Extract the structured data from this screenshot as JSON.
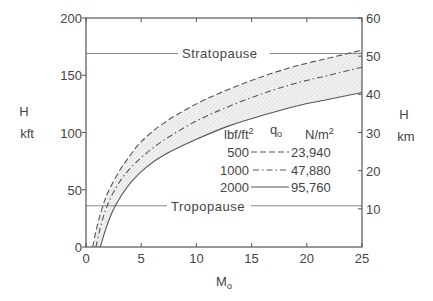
{
  "chart_data": {
    "type": "line",
    "title": "",
    "xlabel": "M",
    "xlabel_subscript": "o",
    "ylabel_left": [
      "H",
      "kft"
    ],
    "ylabel_right": [
      "H",
      "km"
    ],
    "xlim": [
      0,
      25
    ],
    "ylim_left": [
      0,
      200
    ],
    "ylim_right": [
      0,
      60
    ],
    "x_ticks": [
      0,
      5,
      10,
      15,
      20,
      25
    ],
    "x_tick_labels": [
      "0",
      "5",
      "10",
      "15",
      "20",
      "25"
    ],
    "y_left_ticks": [
      0,
      50,
      100,
      150,
      200
    ],
    "y_left_tick_labels": [
      "0",
      "50",
      "100",
      "150",
      "200"
    ],
    "y_right_ticks": [
      10,
      20,
      30,
      40,
      50,
      60
    ],
    "y_right_tick_labels": [
      "10",
      "20",
      "30",
      "40",
      "50",
      "60"
    ],
    "grid": false,
    "shaded_band": "between q=500 and q=2000 curves (hatched)",
    "reference_lines": [
      {
        "name": "Stratopause",
        "y": 169
      },
      {
        "name": "Tropopause",
        "y": 36
      }
    ],
    "legend": {
      "placement": "center-right",
      "title": "q",
      "title_subscript": "o",
      "col_left_header": "lbf/ft",
      "col_left_header_sup": "2",
      "col_right_header": "N/m",
      "col_right_header_sup": "2",
      "entries": [
        {
          "left": "500",
          "right": "23,940",
          "style": "dashed"
        },
        {
          "left": "1000",
          "right": "47,880",
          "style": "dash-dot"
        },
        {
          "left": "2000",
          "right": "95,760",
          "style": "solid"
        }
      ]
    },
    "series": [
      {
        "name": "500 lbf/ft2 (23,940 N/m2)",
        "style": "dashed",
        "x": [
          0.6,
          1.0,
          1.5,
          2,
          3,
          4,
          5,
          7,
          10,
          13,
          16,
          19,
          22,
          25
        ],
        "y": [
          0,
          18,
          35,
          48,
          66,
          80,
          92,
          108,
          125,
          138,
          149,
          158,
          165,
          172
        ]
      },
      {
        "name": "1000 lbf/ft2 (47,880 N/m2)",
        "style": "dash-dot",
        "x": [
          0.9,
          1.3,
          1.8,
          2.5,
          3.5,
          5,
          7,
          10,
          13,
          16,
          19,
          22,
          25
        ],
        "y": [
          0,
          17,
          33,
          48,
          63,
          78,
          93,
          110,
          123,
          134,
          143,
          150,
          157
        ]
      },
      {
        "name": "2000 lbf/ft2 (95,760 N/m2)",
        "style": "solid",
        "x": [
          1.3,
          1.8,
          2.4,
          3.2,
          4.2,
          5.5,
          7,
          10,
          13,
          16,
          19,
          22,
          25
        ],
        "y": [
          0,
          16,
          31,
          45,
          58,
          70,
          80,
          94,
          106,
          115,
          123,
          129,
          135
        ]
      }
    ]
  }
}
